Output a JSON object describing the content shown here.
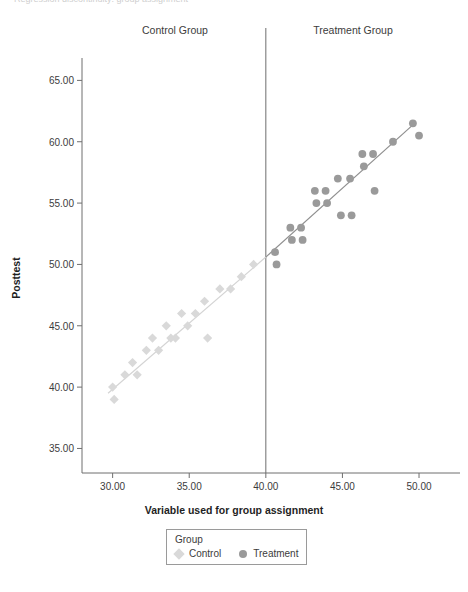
{
  "figure": {
    "clipped_title": "Regression discontinuity: group assignment",
    "group_labels": {
      "control": "Control Group",
      "treatment": "Treatment Group"
    },
    "legend": {
      "title": "Group",
      "items": [
        {
          "label": "Control",
          "marker": "diamond",
          "color": "#d9d9d9"
        },
        {
          "label": "Treatment",
          "marker": "circle",
          "color": "#9a9a9a"
        }
      ]
    }
  },
  "colors": {
    "control_marker": "#d9d9d9",
    "treatment_marker": "#9a9a9a",
    "control_fit_line": "#d4d4d4",
    "treatment_fit_line": "#8f8f8f",
    "axis": "#6e6e6e",
    "cutoff_line": "#6e6e6e",
    "text": "#3c3c3c"
  },
  "chart_data": {
    "type": "scatter",
    "title": "",
    "xlabel": "Variable used for group assignment",
    "ylabel": "Posttest",
    "xlim": [
      28.0,
      51.5
    ],
    "ylim": [
      33.0,
      66.5
    ],
    "xticks": [
      30.0,
      35.0,
      40.0,
      45.0,
      50.0
    ],
    "xtick_labels": [
      "30.00",
      "35.00",
      "40.00",
      "45.00",
      "50.00"
    ],
    "yticks": [
      35.0,
      40.0,
      45.0,
      50.0,
      55.0,
      60.0,
      65.0
    ],
    "ytick_labels": [
      "35.00",
      "40.00",
      "45.00",
      "50.00",
      "55.00",
      "60.00",
      "65.00"
    ],
    "grid": false,
    "legend_position": "bottom-center",
    "cutoff": {
      "x": 40.0,
      "label": "assignment cutoff",
      "style": "vertical-line"
    },
    "series": [
      {
        "name": "Control",
        "marker": "diamond",
        "color": "#d9d9d9",
        "points": [
          [
            30.0,
            40.0
          ],
          [
            30.1,
            39.0
          ],
          [
            30.8,
            41.0
          ],
          [
            31.3,
            42.0
          ],
          [
            31.6,
            41.0
          ],
          [
            32.2,
            43.0
          ],
          [
            32.6,
            44.0
          ],
          [
            33.0,
            43.0
          ],
          [
            33.5,
            45.0
          ],
          [
            33.8,
            44.0
          ],
          [
            34.1,
            44.0
          ],
          [
            34.5,
            46.0
          ],
          [
            34.9,
            45.0
          ],
          [
            35.4,
            46.0
          ],
          [
            36.0,
            47.0
          ],
          [
            36.2,
            44.0
          ],
          [
            37.0,
            48.0
          ],
          [
            37.7,
            48.0
          ],
          [
            38.4,
            49.0
          ],
          [
            39.2,
            50.0
          ]
        ]
      },
      {
        "name": "Treatment",
        "marker": "circle",
        "color": "#9a9a9a",
        "points": [
          [
            40.6,
            51.0
          ],
          [
            40.7,
            50.0
          ],
          [
            41.6,
            53.0
          ],
          [
            41.7,
            52.0
          ],
          [
            42.3,
            53.0
          ],
          [
            42.4,
            52.0
          ],
          [
            43.2,
            56.0
          ],
          [
            43.3,
            55.0
          ],
          [
            43.9,
            56.0
          ],
          [
            44.0,
            55.0
          ],
          [
            44.7,
            57.0
          ],
          [
            44.9,
            54.0
          ],
          [
            45.5,
            57.0
          ],
          [
            45.6,
            54.0
          ],
          [
            46.3,
            59.0
          ],
          [
            46.4,
            58.0
          ],
          [
            47.0,
            59.0
          ],
          [
            47.1,
            56.0
          ],
          [
            48.3,
            60.0
          ],
          [
            49.6,
            61.5
          ],
          [
            50.0,
            60.5
          ]
        ]
      }
    ],
    "fit_lines": [
      {
        "name": "Control fit",
        "color": "#d4d4d4",
        "x": [
          29.7,
          40.0
        ],
        "y": [
          39.5,
          50.6
        ]
      },
      {
        "name": "Treatment fit",
        "color": "#8f8f8f",
        "x": [
          40.0,
          49.8
        ],
        "y": [
          50.6,
          61.6
        ]
      }
    ]
  }
}
